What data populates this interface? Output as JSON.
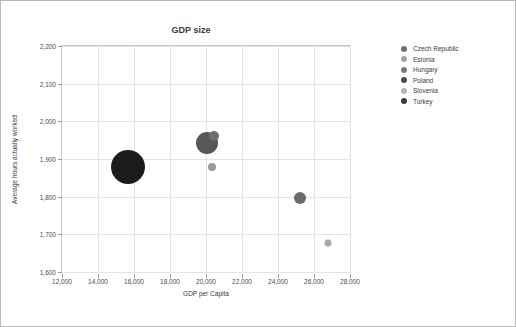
{
  "chart_data": {
    "type": "scatter",
    "title": "GDP size",
    "xlabel": "GDP per Capita",
    "ylabel": "Average hours actually worked",
    "xlim": [
      12000,
      28000
    ],
    "ylim": [
      1600,
      2200
    ],
    "xticks": [
      "12,000",
      "14,000",
      "16,000",
      "18,000",
      "20,000",
      "22,000",
      "24,000",
      "26,000",
      "28,000"
    ],
    "xtick_values": [
      12000,
      14000,
      16000,
      18000,
      20000,
      22000,
      24000,
      26000,
      28000
    ],
    "yticks": [
      "1,600",
      "1,700",
      "1,800",
      "1,900",
      "2,000",
      "2,100",
      "2,200"
    ],
    "ytick_values": [
      1600,
      1700,
      1800,
      1900,
      2000,
      2100,
      2200
    ],
    "grid": true,
    "legend_position": "right",
    "series": [
      {
        "name": "Czech Republic",
        "x": 20050,
        "y": 1943,
        "size": 22,
        "color": "#575757"
      },
      {
        "name": "Estonia",
        "x": 20350,
        "y": 1879,
        "size": 8,
        "color": "#9a9a9a"
      },
      {
        "name": "Hungary",
        "x": 20450,
        "y": 1961,
        "size": 10,
        "color": "#6e6e6e"
      },
      {
        "name": "Poland",
        "x": 15650,
        "y": 1878,
        "size": 34,
        "color": "#1c1c1c"
      },
      {
        "name": "Slovenia",
        "x": 26800,
        "y": 1676,
        "size": 7,
        "color": "#a8a8a8"
      },
      {
        "name": "Turkey",
        "x": 25200,
        "y": 1797,
        "size": 12,
        "color": "#6b6b6b"
      }
    ]
  },
  "legend": {
    "items": [
      {
        "label": "Czech Republic",
        "color": "#6f6f6f"
      },
      {
        "label": "Estonia",
        "color": "#a5a5a5"
      },
      {
        "label": "Hungary",
        "color": "#7b7b7b"
      },
      {
        "label": "Poland",
        "color": "#4a4a4a"
      },
      {
        "label": "Slovenia",
        "color": "#b5b5b5"
      },
      {
        "label": "Turkey",
        "color": "#3a3a3a"
      }
    ]
  }
}
